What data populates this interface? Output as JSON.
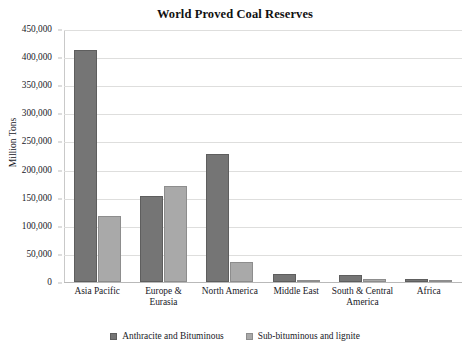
{
  "chart_data": {
    "type": "bar",
    "title": "World Proved Coal Reserves",
    "xlabel": "",
    "ylabel": "Million Tons",
    "ylim": [
      0,
      450000
    ],
    "ytick_step": 50000,
    "ytick_labels": [
      "0",
      "50,000",
      "100,000",
      "150,000",
      "200,000",
      "250,000",
      "300,000",
      "350,000",
      "400,000",
      "450,000"
    ],
    "grid": true,
    "legend_position": "bottom",
    "categories": [
      "Asia Pacific",
      "Europe & Eurasia",
      "North America",
      "Middle East",
      "South & Central America",
      "Africa"
    ],
    "series": [
      {
        "name": "Anthracite and Bituminous",
        "color": "#757575",
        "values": [
          413000,
          153000,
          228000,
          14000,
          12000,
          5000
        ]
      },
      {
        "name": "Sub-bituminous and lignite",
        "color": "#a9a9a9",
        "values": [
          117000,
          170000,
          35000,
          1000,
          5500,
          1000
        ]
      }
    ]
  }
}
